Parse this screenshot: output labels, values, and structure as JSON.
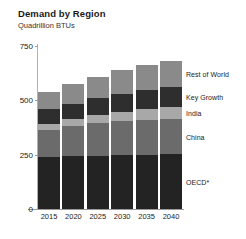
{
  "chart_data": {
    "type": "bar",
    "subtype": "stacked-bar",
    "title": "Demand by Region",
    "subtitle": "Quadrillion BTUs",
    "xlabel": "",
    "ylabel": "",
    "categories": [
      "2015",
      "2020",
      "2025",
      "2030",
      "2035",
      "2040"
    ],
    "ylim": [
      0,
      750
    ],
    "yticks": [
      0,
      250,
      750
    ],
    "ytick_labels": [
      "0",
      "250",
      "500",
      "750"
    ],
    "ytick_values": [
      0,
      250,
      500,
      750
    ],
    "grid": false,
    "legend_position": "right-inline",
    "series": [
      {
        "name": "OECD*",
        "color": "#232323",
        "values": [
          240,
          243,
          246,
          248,
          250,
          252
        ]
      },
      {
        "name": "China",
        "color": "#6b6b6b",
        "values": [
          125,
          137,
          148,
          155,
          160,
          163
        ]
      },
      {
        "name": "India",
        "color": "#a8a8a8",
        "values": [
          28,
          33,
          38,
          43,
          48,
          52
        ]
      },
      {
        "name": "Key Growth",
        "color": "#2e2e2e",
        "values": [
          66,
          72,
          78,
          84,
          90,
          96
        ]
      },
      {
        "name": "Rest of World",
        "color": "#8a8a8a",
        "values": [
          78,
          88,
          98,
          108,
          116,
          120
        ]
      }
    ],
    "totals": [
      537,
      573,
      608,
      638,
      664,
      683
    ]
  },
  "legend": {
    "items": [
      {
        "label": "Rest of World"
      },
      {
        "label": "Key Growth"
      },
      {
        "label": "India"
      },
      {
        "label": "China"
      },
      {
        "label": "OECD*"
      }
    ]
  },
  "colors": {
    "background": "#ffffff",
    "text": "#1a1a1a",
    "axis": "#9a9a9a"
  }
}
